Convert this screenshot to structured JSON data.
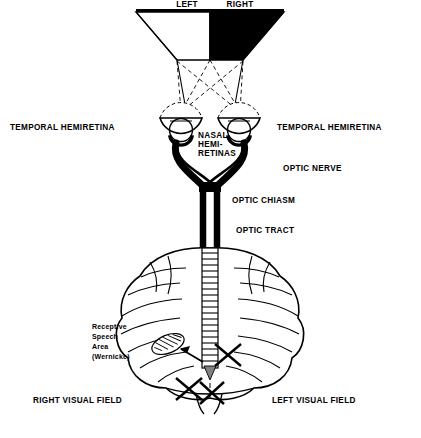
{
  "figure": {
    "title_hidden": "",
    "colors": {
      "ink": "#000000",
      "paper": "#ffffff",
      "fill_black": "#000000"
    },
    "top_field": {
      "left_label": "LEFT",
      "right_label": "RIGHT"
    },
    "labels": {
      "temporal_left": "TEMPORAL HEMIRETINA",
      "temporal_right": "TEMPORAL HEMIRETINA",
      "nasal_line1": "NASAL",
      "nasal_line2": "HEMI-",
      "nasal_line3": "RETINAS",
      "optic_nerve": "OPTIC NERVE",
      "optic_chiasm": "OPTIC CHIASM",
      "optic_tract": "OPTIC TRACT",
      "wernicke_line1": "Receptive",
      "wernicke_line2": "Speech",
      "wernicke_line3": "Area",
      "wernicke_line4": "(Wernicke)",
      "right_visual_field": "RIGHT VISUAL FIELD",
      "left_visual_field": "LEFT VISUAL FIELD"
    }
  }
}
